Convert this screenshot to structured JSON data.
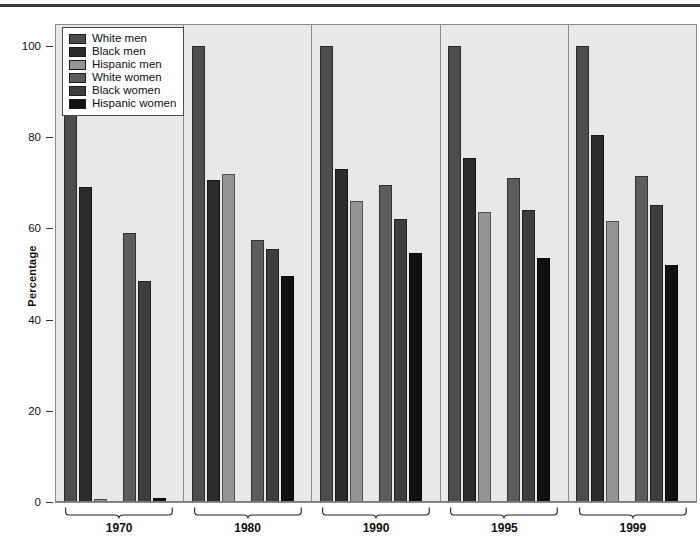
{
  "chart_data": {
    "type": "bar",
    "title": "",
    "subtitle": "",
    "xlabel": "",
    "ylabel": "Percentage",
    "ylim": [
      0,
      105
    ],
    "yticks": [
      0,
      20,
      40,
      60,
      80,
      100
    ],
    "grid": false,
    "legend_position": "top-left",
    "categories": [
      "1970",
      "1980",
      "1990",
      "1995",
      "1999"
    ],
    "series": [
      {
        "name": "White men",
        "color": "#4d4d4d",
        "values": [
          100,
          100,
          100,
          100,
          100
        ]
      },
      {
        "name": "Black men",
        "color": "#2b2b2b",
        "values": [
          69,
          70.5,
          73,
          75.5,
          80.5
        ]
      },
      {
        "name": "Hispanic men",
        "color": "#949494",
        "values": [
          0.6,
          72,
          66,
          63.5,
          61.5
        ]
      },
      {
        "name": "White women",
        "color": "#5c5c5c",
        "values": [
          59,
          57.5,
          69.5,
          71,
          71.5
        ]
      },
      {
        "name": "Black women",
        "color": "#3d3d3d",
        "values": [
          48.5,
          55.5,
          62,
          64,
          65
        ]
      },
      {
        "name": "Hispanic women",
        "color": "#111111",
        "values": [
          0.8,
          49.5,
          54.5,
          53.5,
          52
        ]
      }
    ]
  },
  "legend": {
    "items": [
      {
        "label": "White men"
      },
      {
        "label": "Black men"
      },
      {
        "label": "Hispanic men"
      },
      {
        "label": "White women"
      },
      {
        "label": "Black women"
      },
      {
        "label": "Hispanic women"
      }
    ]
  },
  "axis": {
    "y_label": "Percentage",
    "y_ticks": [
      "100",
      "80",
      "60",
      "40",
      "20",
      "0"
    ]
  },
  "x_groups": [
    "1970",
    "1980",
    "1990",
    "1995",
    "1999"
  ],
  "colors": {
    "plot_background": "#e8e8e8",
    "page_background": "#ffffff",
    "frame": "#8b8b8b",
    "top_rule": "#3a3a3a",
    "text": "#111111"
  }
}
